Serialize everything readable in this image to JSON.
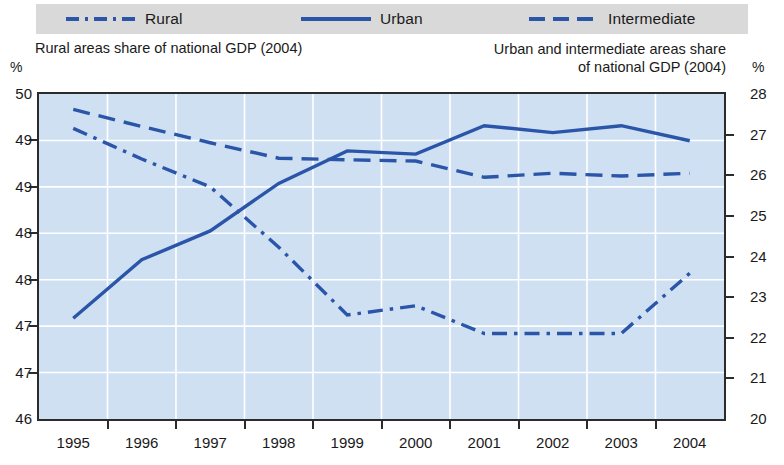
{
  "legend": {
    "items": [
      {
        "label": "Rural",
        "style": "dash-dot",
        "icon": "line-dash-dot-swatch",
        "color": "#2a55a8"
      },
      {
        "label": "Urban",
        "style": "solid",
        "icon": "line-solid-swatch",
        "color": "#2a55a8"
      },
      {
        "label": "Intermediate",
        "style": "dashed",
        "icon": "line-dashed-swatch",
        "color": "#2a55a8"
      }
    ]
  },
  "titles": {
    "left": "Rural areas share of national GDP (2004)",
    "right_line1": "Urban and intermediate areas share",
    "right_line2": "of national GDP (2004)"
  },
  "axes": {
    "left_unit": "%",
    "right_unit": "%"
  },
  "chart_data": {
    "type": "line",
    "xlabel": "",
    "ylabel": "Rural areas share of national GDP (2004)",
    "y2label": "Urban and intermediate areas share of national GDP (2004)",
    "grid": true,
    "legend_position": "top",
    "x": [
      "1995",
      "1996",
      "1997",
      "1998",
      "1999",
      "2000",
      "2001",
      "2002",
      "2003",
      "2004"
    ],
    "categories": [
      "1995",
      "1996",
      "1997",
      "1998",
      "1999",
      "2000",
      "2001",
      "2002",
      "2003",
      "2004"
    ],
    "ylim": [
      46.5,
      50.0
    ],
    "y2lim": [
      20,
      28
    ],
    "yticks": [
      50.0,
      49.5,
      49.0,
      48.5,
      48.0,
      47.5,
      47.0,
      46.5
    ],
    "ytick_labels": [
      "50",
      "49",
      "49",
      "48",
      "48",
      "47",
      "47",
      "46"
    ],
    "y2ticks": [
      28,
      27,
      26,
      25,
      24,
      23,
      22,
      21,
      20
    ],
    "y2tick_labels": [
      "28",
      "27",
      "26",
      "25",
      "24",
      "23",
      "22",
      "21",
      "20"
    ],
    "series": [
      {
        "name": "Rural",
        "axis": "left",
        "style": "dash-dot",
        "color": "#2a55a8",
        "values": [
          49.63,
          49.3,
          49.0,
          48.35,
          47.62,
          47.72,
          47.42,
          47.42,
          47.42,
          48.07
        ]
      },
      {
        "name": "Urban",
        "axis": "right",
        "style": "solid",
        "color": "#2a55a8",
        "values": [
          22.48,
          23.92,
          24.63,
          25.8,
          26.6,
          26.52,
          27.22,
          27.05,
          27.22,
          26.85
        ]
      },
      {
        "name": "Intermediate",
        "axis": "right",
        "style": "dashed",
        "color": "#2a55a8",
        "values": [
          27.62,
          27.2,
          26.8,
          26.42,
          26.38,
          26.35,
          25.95,
          26.05,
          25.98,
          26.05
        ]
      }
    ]
  }
}
